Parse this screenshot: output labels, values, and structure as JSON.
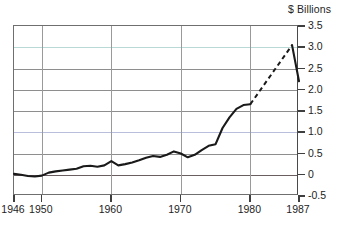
{
  "chart_data": {
    "type": "line",
    "title": "",
    "subtitle": "",
    "xlabel": "",
    "ylabel": "$ Billions",
    "unit_caption": "$ Billions",
    "xlim": [
      1946,
      1987
    ],
    "ylim": [
      -0.5,
      3.5
    ],
    "grid": true,
    "legend": "none",
    "y_ticks": [
      "3.5",
      "3.0",
      "2.5",
      "2.0",
      "1.5",
      "1.0",
      "0.5",
      "0",
      "-0.5"
    ],
    "y_tick_values": [
      3.5,
      3.0,
      2.5,
      2.0,
      1.5,
      1.0,
      0.5,
      0,
      -0.5
    ],
    "x_ticks": [
      "1946",
      "1950",
      "1960",
      "1970",
      "1980",
      "1987"
    ],
    "x_tick_values": [
      1946,
      1950,
      1960,
      1970,
      1980,
      1987
    ],
    "series": [
      {
        "name": "actual",
        "style": "solid",
        "color": "#1a1a1a",
        "x": [
          1946,
          1947,
          1948,
          1949,
          1950,
          1951,
          1952,
          1953,
          1954,
          1955,
          1956,
          1957,
          1958,
          1959,
          1960,
          1961,
          1962,
          1963,
          1964,
          1965,
          1966,
          1967,
          1968,
          1969,
          1970,
          1971,
          1972,
          1973,
          1974,
          1975,
          1976,
          1977,
          1978,
          1979,
          1980
        ],
        "values": [
          0.02,
          0.0,
          -0.03,
          -0.04,
          -0.02,
          0.05,
          0.08,
          0.1,
          0.12,
          0.14,
          0.2,
          0.21,
          0.19,
          0.22,
          0.32,
          0.22,
          0.25,
          0.29,
          0.34,
          0.4,
          0.44,
          0.42,
          0.47,
          0.55,
          0.5,
          0.41,
          0.47,
          0.58,
          0.68,
          0.72,
          1.1,
          1.35,
          1.55,
          1.64,
          1.66
        ]
      },
      {
        "name": "projection",
        "style": "dashed",
        "color": "#1a1a1a",
        "x": [
          1980,
          1986
        ],
        "values": [
          1.66,
          3.05
        ]
      },
      {
        "name": "revision",
        "style": "solid",
        "color": "#1a1a1a",
        "x": [
          1986,
          1987
        ],
        "values": [
          3.05,
          2.2
        ]
      }
    ]
  },
  "axes": {
    "unit_caption": "$ Billions"
  }
}
